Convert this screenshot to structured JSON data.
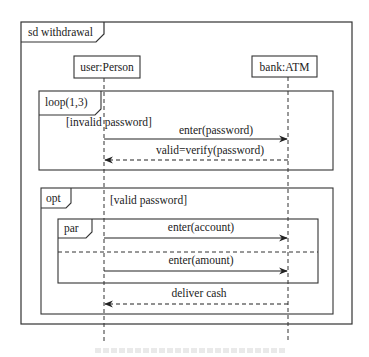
{
  "diagram": {
    "type": "uml-sequence",
    "frame_label": "sd withdrawal",
    "lifelines": [
      {
        "name": "user:Person",
        "x": 104
      },
      {
        "name": "bank:ATM",
        "x": 288
      }
    ],
    "fragments": [
      {
        "operator": "loop(1,3)",
        "guard": "[invalid password]",
        "messages": [
          {
            "label": "enter(password)",
            "from": "user:Person",
            "to": "bank:ATM",
            "style": "sync"
          },
          {
            "label": "valid=verify(password)",
            "from": "bank:ATM",
            "to": "user:Person",
            "style": "return"
          }
        ]
      },
      {
        "operator": "opt",
        "guard": "[valid password]",
        "nested": {
          "operator": "par",
          "operands": [
            {
              "messages": [
                {
                  "label": "enter(account)",
                  "from": "user:Person",
                  "to": "bank:ATM",
                  "style": "sync"
                }
              ]
            },
            {
              "messages": [
                {
                  "label": "enter(amount)",
                  "from": "user:Person",
                  "to": "bank:ATM",
                  "style": "sync"
                }
              ]
            }
          ]
        },
        "messages": [
          {
            "label": "deliver cash",
            "from": "bank:ATM",
            "to": "user:Person",
            "style": "return"
          }
        ]
      }
    ],
    "stroke_color": "#333333"
  }
}
